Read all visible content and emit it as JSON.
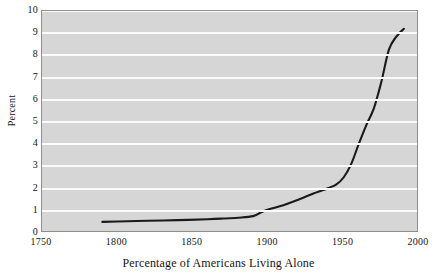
{
  "chart_data": {
    "type": "line",
    "title": "",
    "xlabel": "Percentage of Americans Living Alone",
    "ylabel": "Percent",
    "xlim": [
      1750,
      2000
    ],
    "ylim": [
      0,
      10
    ],
    "grid": true,
    "legend": false,
    "xticks": [
      1750,
      1800,
      1850,
      1900,
      1950,
      2000
    ],
    "xtick_labels": [
      "1750",
      "1800",
      "1850",
      "1900",
      "1950",
      "2000"
    ],
    "yticks": [
      0,
      1,
      2,
      3,
      4,
      5,
      6,
      7,
      8,
      9,
      10
    ],
    "ytick_labels": [
      "0",
      "1",
      "2",
      "3",
      "4",
      "5",
      "6",
      "7",
      "8",
      "9",
      "10"
    ],
    "series": [
      {
        "name": "Percentage of Americans Living Alone",
        "color": "#1a1a1a",
        "x": [
          1790,
          1800,
          1820,
          1840,
          1860,
          1870,
          1880,
          1890,
          1895,
          1900,
          1910,
          1920,
          1930,
          1935,
          1940,
          1945,
          1950,
          1955,
          1960,
          1965,
          1970,
          1975,
          1980,
          1985,
          1990
        ],
        "values": [
          0.5,
          0.52,
          0.55,
          0.58,
          0.62,
          0.65,
          0.69,
          0.76,
          0.92,
          1.06,
          1.25,
          1.5,
          1.78,
          1.9,
          2.03,
          2.18,
          2.5,
          3.1,
          4.0,
          4.85,
          5.6,
          6.8,
          8.25,
          8.85,
          9.2
        ]
      }
    ]
  },
  "axis_colors": {
    "plot_background": "#d6d6d6",
    "gridline": "#fbfbfb",
    "frame": "#8e8e8e",
    "text": "#161616"
  }
}
